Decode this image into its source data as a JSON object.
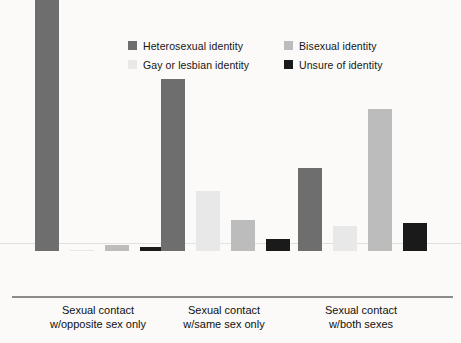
{
  "chart_data": {
    "type": "bar",
    "title": "",
    "subtitle": "",
    "xlabel": "",
    "ylabel": "",
    "ylim": [
      0,
      100
    ],
    "grid": "single faint horizontal gridline",
    "legend_position": "top-right, 2x2 grid",
    "value_suffix": "%",
    "categories": [
      "Sexual contact w/opposite sex only",
      "Sexual contact w/same sex only",
      "Sexual contact w/both sexes"
    ],
    "category_lines": [
      [
        "Sexual contact",
        "w/opposite sex only"
      ],
      [
        "Sexual contact",
        "w/same sex only"
      ],
      [
        "Sexual contact",
        "w/both sexes"
      ]
    ],
    "series": [
      {
        "name": "Heterosexual identity",
        "color": "#6e6e6e",
        "values": [
          96.3,
          61.7,
          29.8
        ],
        "labels": [
          "96.3%",
          "61.7%",
          "29.8%"
        ]
      },
      {
        "name": "Gay or lesbian identity",
        "color": "#e8e8e8",
        "values": [
          0.4,
          21.7,
          9.1
        ],
        "labels": [
          "0.4%",
          "21.7%",
          "9.1%"
        ]
      },
      {
        "name": "Bisexual identity",
        "color": "#bcbcbc",
        "values": [
          2.0,
          11.3,
          50.9
        ],
        "labels": [
          "2.0%",
          "11.3%",
          "50.9%"
        ]
      },
      {
        "name": "Unsure of identity",
        "color": "#1a1a1a",
        "values": [
          1.4,
          4.4,
          10.1
        ],
        "labels": [
          "1.4%",
          "4.4%",
          "10.1%"
        ]
      }
    ]
  },
  "legend": {
    "entries": [
      {
        "label": "Heterosexual identity",
        "color": "#6e6e6e"
      },
      {
        "label": "Bisexual identity",
        "color": "#bcbcbc"
      },
      {
        "label": "Gay or lesbian identity",
        "color": "#e8e8e8"
      },
      {
        "label": "Unsure of identity",
        "color": "#1a1a1a"
      }
    ]
  }
}
